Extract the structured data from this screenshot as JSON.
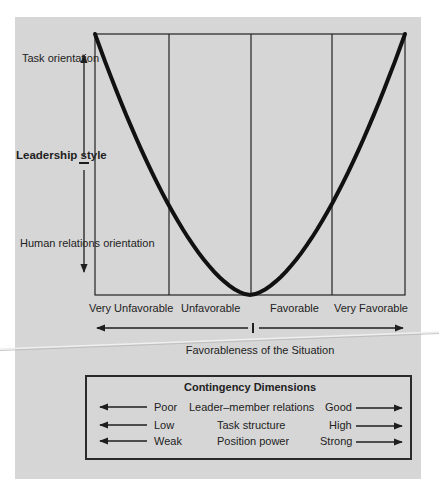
{
  "diagram": {
    "y_axis": {
      "title": "Leadership style",
      "top_label": "Task orientation",
      "bottom_label": "Human relations orientation"
    },
    "x_axis": {
      "title": "Favorableness of the Situation",
      "categories": [
        "Very Unfavorable",
        "Unfavorable",
        "Favorable",
        "Very Favorable"
      ]
    },
    "curve": {
      "shape": "U-shaped parabola",
      "description": "Task orientation high at very unfavorable and very favorable situations; human relations orientation highest at moderate favorableness",
      "points": [
        {
          "x": 0.0,
          "y": 1.0
        },
        {
          "x": 1.0,
          "y": 0.33
        },
        {
          "x": 2.0,
          "y": 0.0
        },
        {
          "x": 3.0,
          "y": 0.32
        },
        {
          "x": 4.0,
          "y": 1.0
        }
      ]
    },
    "contingency": {
      "title": "Contingency Dimensions",
      "rows": [
        {
          "left": "Poor",
          "dimension": "Leader–member relations",
          "right": "Good"
        },
        {
          "left": "Low",
          "dimension": "Task structure",
          "right": "High"
        },
        {
          "left": "Weak",
          "dimension": "Position power",
          "right": "Strong"
        }
      ]
    },
    "colors": {
      "panel": "#d6d6d6",
      "ink": "#1e1e1e"
    }
  }
}
